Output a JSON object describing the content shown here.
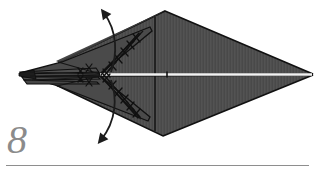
{
  "figure": {
    "kind": "origami-fold-diagram",
    "step_label": "8",
    "background_color": "#ffffff",
    "paper_fill": "#4e4e4e",
    "paper_fill_shade": "#454545",
    "paper_fill_light": "#575757",
    "edge_color": "#111111",
    "crease_color": "#1a1a1a",
    "highlight_color": "#f2f2f2",
    "arrow_color": "#1c1c1c",
    "rule_color": "#8e8e8e",
    "step_number_color": "#8b8b8b",
    "geometry": {
      "left_tip": [
        20,
        73
      ],
      "right_tip": [
        313,
        74
      ],
      "top_vertex": [
        165,
        11
      ],
      "bottom_vertex": [
        163,
        136
      ],
      "center_axis_y": 74,
      "vertical_crease_x": 155,
      "crimp_apex": [
        101,
        75
      ]
    },
    "annotations": {
      "arrow_top_label": "fold-up-arrow",
      "arrow_bottom_label": "fold-down-arrow",
      "crimp_label": "crimp-zigzag-marks",
      "center_line_label": "center-highlight-line"
    }
  }
}
